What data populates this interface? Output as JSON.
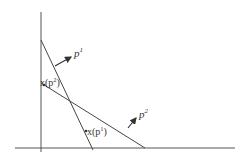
{
  "diagram": {
    "type": "budget-lines-revealed-preference",
    "colors": {
      "line": "#444444",
      "axis": "#555555",
      "text": "#333333",
      "background": "#ffffff"
    },
    "axes": {
      "vertical": {
        "x": 41,
        "y1": 12,
        "y2": 152
      },
      "horizontal": {
        "y": 148,
        "x1": 15,
        "x2": 235
      }
    },
    "lines": [
      {
        "name": "budget-line-p1",
        "x1": 41,
        "y1": 40,
        "x2": 93,
        "y2": 150
      },
      {
        "name": "budget-line-p2",
        "x1": 41,
        "y1": 83,
        "x2": 145,
        "y2": 148
      }
    ],
    "vectors": [
      {
        "name": "price-vector-p1",
        "x1": 55,
        "y1": 66,
        "x2": 72,
        "y2": 56
      },
      {
        "name": "price-vector-p2",
        "x1": 128,
        "y1": 128,
        "x2": 137,
        "y2": 117
      }
    ],
    "labels": {
      "p1": {
        "base": "p",
        "sup": "1"
      },
      "p2": {
        "base": "p",
        "sup": "2"
      },
      "x_p2": {
        "prefix": "x(p",
        "sup": "2",
        "suffix": ")"
      },
      "x_p1": {
        "prefix": "x(p",
        "sup": "1",
        "suffix": ")"
      }
    }
  }
}
